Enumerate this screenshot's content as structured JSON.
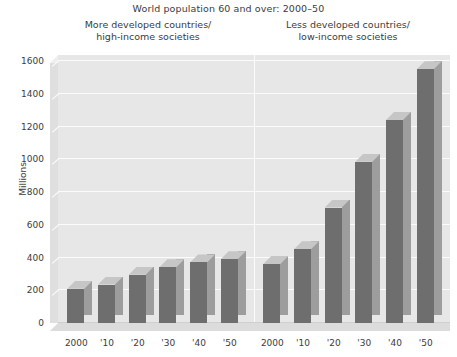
{
  "chart_data": {
    "type": "bar",
    "title": "World population 60 and over: 2000–50",
    "xlabel": "",
    "ylabel": "Millions",
    "ylim": [
      0,
      1600
    ],
    "ytick_step": 200,
    "yticks": [
      0,
      200,
      400,
      600,
      800,
      1000,
      1200,
      1400,
      1600
    ],
    "grid": true,
    "legend": "none",
    "style": "3d-bars",
    "categories": [
      "2000",
      "'10",
      "'20",
      "'30",
      "'40",
      "'50"
    ],
    "panels": [
      {
        "name": "more-developed",
        "label": "More developed countries/\nhigh-income societies",
        "label_line1": "More developed countries/",
        "label_line2": "high-income societies",
        "values": [
          210,
          235,
          295,
          340,
          370,
          390
        ]
      },
      {
        "name": "less-developed",
        "label": "Less developed countries/\nlow-income societies",
        "label_line1": "Less developed countries/",
        "label_line2": "low-income societies",
        "values": [
          360,
          450,
          705,
          985,
          1240,
          1550
        ]
      }
    ],
    "colors": {
      "bar_front": "#6e6e6e",
      "bar_side": "#9d9d9d",
      "bar_top": "#c6c6c6",
      "plot_background": "#e7e7e7",
      "gridline": "#fbfbfb",
      "text": "#3c3c3c",
      "page_background": "#ffffff"
    }
  }
}
